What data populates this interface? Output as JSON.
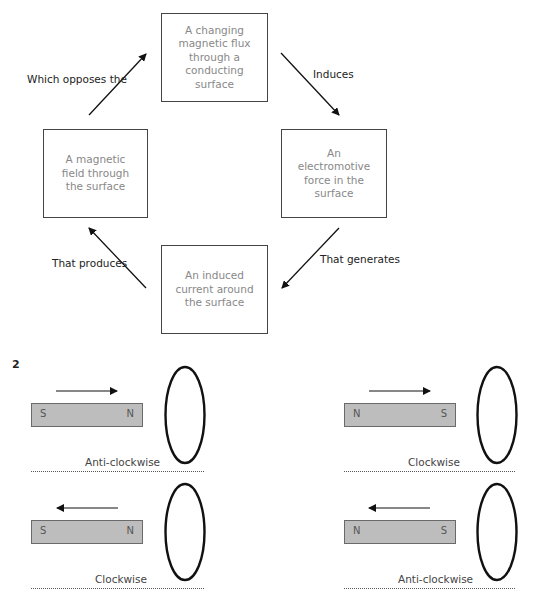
{
  "cycle_diagram": {
    "boxes": {
      "top": "A changing\nmagnetic flux\nthrough a\nconducting surface",
      "right": "An\nelectromotive\nforce in the\nsurface",
      "bottom": "An induced\ncurrent around\nthe surface",
      "left": "A magnetic\nfield through\nthe surface"
    },
    "edges": {
      "top_to_right": "Induces",
      "right_to_bottom": "That generates",
      "bottom_to_left": "That produces",
      "left_to_top": "Which opposes the"
    }
  },
  "question_number": "2",
  "magnet_panels": [
    {
      "id": "top-left",
      "left_pole": "S",
      "right_pole": "N",
      "motion": "right",
      "result": "Anti-clockwise"
    },
    {
      "id": "top-right",
      "left_pole": "N",
      "right_pole": "S",
      "motion": "right",
      "result": "Clockwise"
    },
    {
      "id": "bottom-left",
      "left_pole": "S",
      "right_pole": "N",
      "motion": "left",
      "result": "Clockwise"
    },
    {
      "id": "bottom-right",
      "left_pole": "N",
      "right_pole": "S",
      "motion": "left",
      "result": "Anti-clockwise"
    }
  ]
}
